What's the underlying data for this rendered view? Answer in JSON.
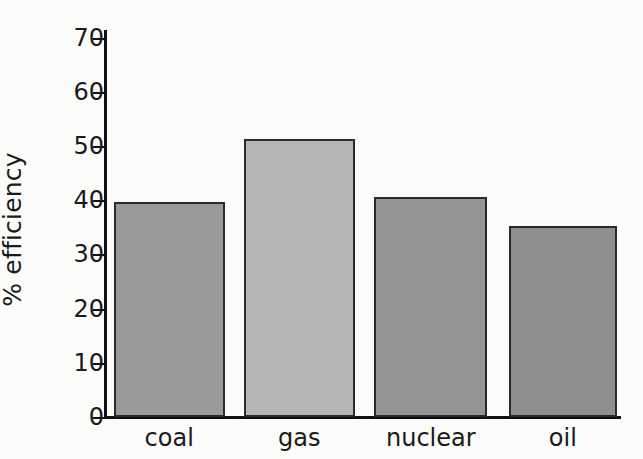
{
  "chart_data": {
    "type": "bar",
    "title": "",
    "xlabel": "",
    "ylabel": "% efficiency",
    "categories": [
      "coal",
      "gas",
      "nuclear",
      "oil"
    ],
    "values": [
      39.7,
      51.3,
      40.6,
      35.2
    ],
    "ylim": [
      0,
      70
    ],
    "yticks": [
      0,
      10,
      20,
      30,
      40,
      50,
      60,
      70
    ],
    "ytick_labels": [
      "0",
      "10",
      "20",
      "30",
      "40",
      "50",
      "60",
      "70"
    ],
    "grid": false,
    "legend": null,
    "bar_colors": [
      "#9a9a9a",
      "#b5b5b5",
      "#959595",
      "#8e8e8e"
    ],
    "bar_edge_color": "#2a2a2a",
    "axis_color": "#111111",
    "background_color": "#fbfbfa",
    "text_color": "#1a1a1a"
  }
}
